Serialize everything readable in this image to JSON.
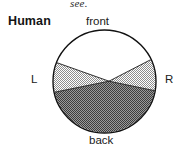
{
  "figure": {
    "name": "human-visual-field-diagram",
    "caption_fragment": "see.",
    "organism_label": "Human",
    "labels": {
      "front": "front",
      "back": "back",
      "left": "L",
      "right": "R"
    }
  },
  "diagram": {
    "type": "sector-circle",
    "circle": {
      "cx": 104.5,
      "cy": 81.5,
      "r": 51.5,
      "stroke": "#111111",
      "stroke_width": 1.3,
      "fill": "#ffffff"
    },
    "convergence_point": {
      "x": 109,
      "y": 81
    },
    "sectors": [
      {
        "name": "front-unshaded-sector",
        "region": "front",
        "fill_style": "none",
        "fill": "#ffffff",
        "description": "unshaded forward visual field"
      },
      {
        "name": "left-light-sector",
        "region": "L",
        "fill_style": "light-checker",
        "fill": "#b0b0b0",
        "description": "light stippled left lateral field"
      },
      {
        "name": "right-light-sector",
        "region": "R",
        "fill_style": "light-checker",
        "fill": "#b0b0b0",
        "description": "light stippled right lateral field"
      },
      {
        "name": "back-dark-sector",
        "region": "back",
        "fill_style": "dark-checker",
        "fill": "#6e6e6e",
        "description": "dark stippled rear blind field"
      }
    ],
    "colors": {
      "outline": "#111111",
      "light_shade": "#b0b0b0",
      "dark_shade": "#6e6e6e",
      "background": "#ffffff",
      "text": "#1c1c1c"
    }
  }
}
